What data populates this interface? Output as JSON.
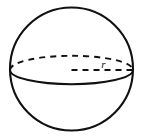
{
  "figure": {
    "name": "sphere-with-radius",
    "background_color": "#ffffff",
    "stroke_color": "#111111",
    "labels": {
      "radius": "r"
    },
    "geometry": {
      "canvas": {
        "width": 146,
        "height": 138
      },
      "sphere_outline": {
        "shape": "circle",
        "cx": 71.5,
        "cy": 69,
        "r": 61.5,
        "stroke_width": 2.1,
        "style": "solid"
      },
      "equator": {
        "shape": "ellipse",
        "cx": 71.5,
        "cy": 70,
        "rx": 61.5,
        "ry": 14.2,
        "back_half": {
          "style": "dashed",
          "stroke_width": 1.9,
          "dash_pattern": "6 5"
        },
        "front_half": {
          "style": "solid",
          "stroke_width": 1.9
        }
      },
      "radius_segment": {
        "x1": 71.5,
        "y1": 70,
        "x2": 133,
        "y2": 70,
        "style": "dashed",
        "stroke_width": 1.9,
        "dash_pattern": "6 5"
      },
      "radius_label_position": {
        "x": 103.5,
        "y": 67.5
      }
    }
  }
}
